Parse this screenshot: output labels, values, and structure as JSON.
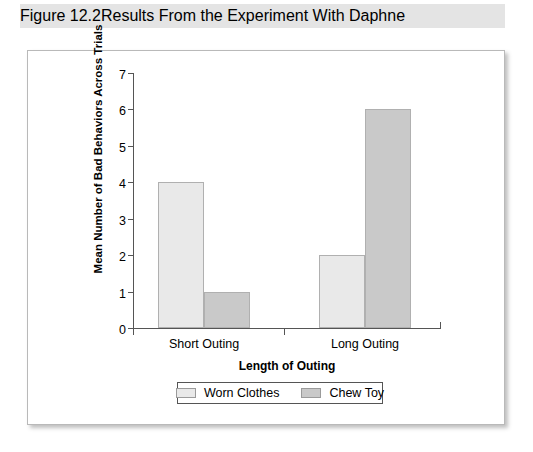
{
  "header": {
    "figure_number": "Figure 12.2",
    "title": "Results From the Experiment With Daphne"
  },
  "chart_data": {
    "type": "bar",
    "title": "Results From the Experiment With Daphne",
    "xlabel": "Length of Outing",
    "ylabel": "Mean Number of Bad Behaviors Across Trials",
    "categories": [
      "Short Outing",
      "Long Outing"
    ],
    "series": [
      {
        "name": "Worn Clothes",
        "values": [
          4,
          2
        ],
        "color": "#e9e9e9"
      },
      {
        "name": "Chew Toy",
        "values": [
          1,
          6
        ],
        "color": "#c9c9c9"
      }
    ],
    "ylim": [
      0,
      7
    ],
    "yticks": [
      "0",
      "1",
      "2",
      "3",
      "4",
      "5",
      "6",
      "7"
    ],
    "grid": false,
    "legend_position": "bottom"
  },
  "axis": {
    "y_ticks": [
      "7",
      "6",
      "5",
      "4",
      "3",
      "2",
      "1",
      "0"
    ]
  },
  "legend": {
    "entries": [
      "Worn Clothes",
      "Chew Toy"
    ]
  }
}
